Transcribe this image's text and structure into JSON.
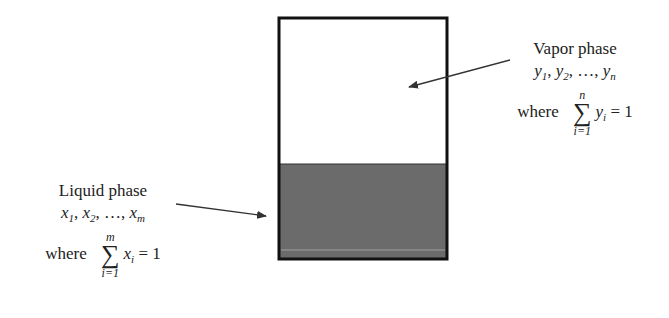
{
  "diagram": {
    "type": "vapor-liquid-equilibrium-vessel",
    "colors": {
      "border": "#111111",
      "liquid": "#6b6b6b",
      "vapor": "#ffffff",
      "arrow": "#333333"
    },
    "vapor": {
      "title": "Vapor phase",
      "variable": "y",
      "list_text": ", …, ",
      "sub1": "1",
      "sub2": "2",
      "subn": "n",
      "where": "where",
      "sum_upper": "n",
      "sum_lower": "i=1",
      "sum_var": "y",
      "sum_sub": "i",
      "equals": "= 1"
    },
    "liquid": {
      "title": "Liquid phase",
      "variable": "x",
      "list_text": ", …, ",
      "sub1": "1",
      "sub2": "2",
      "subn": "m",
      "where": "where",
      "sum_upper": "m",
      "sum_lower": "i=1",
      "sum_var": "x",
      "sum_sub": "i",
      "equals": "= 1"
    }
  }
}
